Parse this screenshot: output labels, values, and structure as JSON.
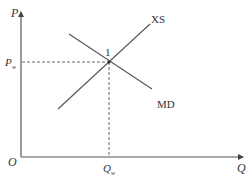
{
  "diagram": {
    "title": "",
    "axes": {
      "y_label": "P",
      "x_label": "Q",
      "origin_label": "O"
    },
    "curves": [
      {
        "name": "XS",
        "label": "XS",
        "slope": "upward"
      },
      {
        "name": "MD",
        "label": "MD",
        "slope": "downward"
      }
    ],
    "equilibrium": {
      "point_label": "1",
      "price_label": "P",
      "price_subscript": "w",
      "quantity_label": "Q",
      "quantity_subscript": "w"
    },
    "colors": {
      "line": "#555555",
      "text": "#333333",
      "background": "#ffffff"
    }
  }
}
